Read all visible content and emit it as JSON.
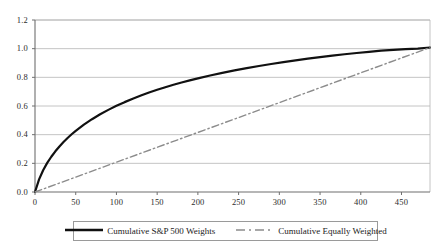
{
  "chart_data": {
    "type": "line",
    "title": "",
    "xlabel": "",
    "ylabel": "",
    "xlim": [
      0,
      485
    ],
    "ylim": [
      0.0,
      1.2
    ],
    "grid": true,
    "grid_axis": "y",
    "legend_position": "bottom",
    "x_ticks": [
      "0",
      "50",
      "100",
      "150",
      "200",
      "250",
      "300",
      "350",
      "400",
      "450"
    ],
    "x_tick_values": [
      0,
      50,
      100,
      150,
      200,
      250,
      300,
      350,
      400,
      450
    ],
    "y_ticks": [
      "0.0",
      "0.2",
      "0.4",
      "0.6",
      "0.8",
      "1.0",
      "1.2"
    ],
    "y_tick_values": [
      0.0,
      0.2,
      0.4,
      0.6,
      0.8,
      1.0,
      1.2
    ],
    "series": [
      {
        "name": "Cumulative S&P 500 Weights",
        "color": "#111111",
        "style": "solid",
        "width": 2.2,
        "x": [
          0,
          5,
          10,
          15,
          20,
          25,
          30,
          35,
          40,
          45,
          50,
          60,
          70,
          80,
          90,
          100,
          110,
          120,
          130,
          140,
          150,
          160,
          170,
          180,
          190,
          200,
          215,
          230,
          245,
          260,
          275,
          290,
          305,
          320,
          335,
          350,
          365,
          380,
          395,
          410,
          425,
          440,
          455,
          470,
          485
        ],
        "y": [
          0.0,
          0.088,
          0.152,
          0.203,
          0.246,
          0.284,
          0.318,
          0.349,
          0.377,
          0.403,
          0.427,
          0.47,
          0.508,
          0.542,
          0.573,
          0.601,
          0.627,
          0.651,
          0.673,
          0.694,
          0.713,
          0.731,
          0.748,
          0.764,
          0.779,
          0.793,
          0.813,
          0.831,
          0.848,
          0.864,
          0.879,
          0.893,
          0.906,
          0.918,
          0.93,
          0.941,
          0.951,
          0.961,
          0.97,
          0.978,
          0.986,
          0.992,
          0.997,
          1.0,
          1.008
        ]
      },
      {
        "name": "Cumulative Equally Weighted",
        "color": "#8c8c8c",
        "style": "dash-dot",
        "width": 1.4,
        "x": [
          0,
          485
        ],
        "y": [
          0.0,
          1.008
        ]
      }
    ]
  },
  "legend": {
    "entries": [
      {
        "label": "Cumulative S&P 500 Weights",
        "swatch": "solid-line-swatch"
      },
      {
        "label": "Cumulative Equally Weighted",
        "swatch": "dash-dot-line-swatch"
      }
    ]
  },
  "axes": {
    "plot_left_px": 35,
    "plot_right_px": 430,
    "plot_top_px": 20,
    "plot_bottom_px": 192,
    "axis_color": "#6f6f6f",
    "grid_color": "#b5b5b5"
  }
}
